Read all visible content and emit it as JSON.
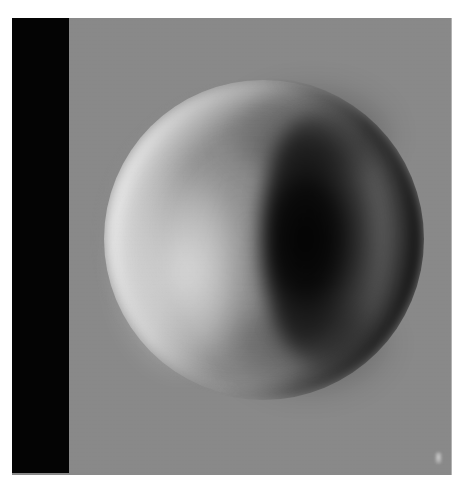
{
  "image": {
    "title": "Grayscale phase-contrast disc image",
    "modality": "phase-contrast-grayscale",
    "canvas": {
      "width_px": 464,
      "height_px": 488,
      "background_color": "#ffffff"
    },
    "frame": {
      "left_px": 12,
      "top_px": 18,
      "width_px": 440,
      "height_px": 457,
      "background_color": "#898989"
    }
  },
  "layers": {
    "occluder_bar": {
      "name": "black-vertical-bar",
      "color": "#040404",
      "left_px": 12,
      "top_px": 18,
      "width_px": 57,
      "height_px": 455
    },
    "specimen": {
      "name": "circular-specimen",
      "shape": "disc",
      "center_x_px": 249,
      "center_y_px": 238,
      "diameter_px": 305,
      "body_color": "#8e8e8e"
    },
    "bright_limb": {
      "name": "bright-crescent",
      "side": "left",
      "peak_color": "#f2f2f2"
    },
    "dark_limb": {
      "name": "dark-crescent",
      "side": "right",
      "peak_color": "#030303"
    },
    "corner_marker": {
      "name": "bright-corner-marker",
      "left_px": 435,
      "top_px": 452,
      "width_px": 7,
      "height_px": 12,
      "color": "#c8c8c8"
    }
  },
  "palette": {
    "background_gray": "#898989",
    "bar_black": "#040404",
    "highlight_white": "#f2f2f2",
    "shadow_black": "#030303",
    "page_white": "#ffffff"
  }
}
